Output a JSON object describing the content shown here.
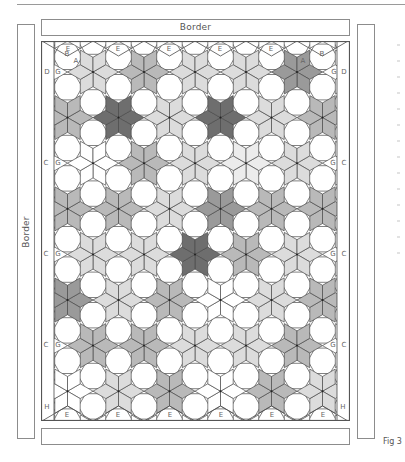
{
  "figure": {
    "label": "Fig 3",
    "border_top_label": "Border",
    "border_left_label": "Border"
  },
  "quilt": {
    "piece_labels": {
      "top": [
        "E",
        "E",
        "E",
        "E",
        "E"
      ],
      "bottom": [
        "E",
        "E",
        "E",
        "E",
        "E",
        "E"
      ],
      "corner_top_left": [
        "B",
        "A",
        "D",
        "G"
      ],
      "corner_top_right": [
        "A",
        "B",
        "G",
        "D"
      ],
      "side_left": [
        "C",
        "G"
      ],
      "side_right": [
        "G",
        "C"
      ],
      "corner_bottom": [
        "H",
        "H"
      ]
    },
    "colors": {
      "white": "#ffffff",
      "very_light": "#ececec",
      "light": "#dcdcdc",
      "mid": "#b9b9b9",
      "mid_dark": "#9a9a9a",
      "dark": "#6e6e6e",
      "line": "#4a4a4a"
    },
    "star_rows": [
      {
        "y": 72,
        "x": [
          93,
          143,
          194,
          245,
          296
        ],
        "shades": [
          "light",
          "mid",
          "light",
          "light",
          "mid_dark"
        ]
      },
      {
        "y": 118,
        "x": [
          67,
          118,
          169,
          220,
          271,
          322
        ],
        "shades": [
          "mid",
          "dark",
          "light",
          "dark",
          "light",
          "mid"
        ]
      },
      {
        "y": 163,
        "x": [
          93,
          143,
          194,
          245,
          296
        ],
        "shades": [
          "white",
          "mid",
          "light",
          "very_light",
          "light"
        ]
      },
      {
        "y": 209,
        "x": [
          68,
          119,
          170,
          221,
          272,
          323
        ],
        "shades": [
          "mid",
          "mid",
          "light",
          "mid_dark",
          "mid",
          "mid"
        ]
      },
      {
        "y": 254,
        "x": [
          93,
          144,
          195,
          247,
          298
        ],
        "shades": [
          "light",
          "light",
          "dark",
          "mid",
          "light"
        ]
      },
      {
        "y": 300,
        "x": [
          68,
          119,
          170,
          221,
          272,
          323
        ],
        "shades": [
          "mid_dark",
          "light",
          "mid",
          "white",
          "light",
          "mid"
        ]
      },
      {
        "y": 346,
        "x": [
          93,
          144,
          195,
          247,
          298
        ],
        "shades": [
          "mid",
          "mid",
          "light",
          "light",
          "mid"
        ]
      },
      {
        "y": 391,
        "x": [
          68,
          119,
          170,
          221,
          272,
          323
        ],
        "shades": [
          "white",
          "light",
          "mid",
          "white",
          "mid",
          "light"
        ]
      }
    ]
  }
}
